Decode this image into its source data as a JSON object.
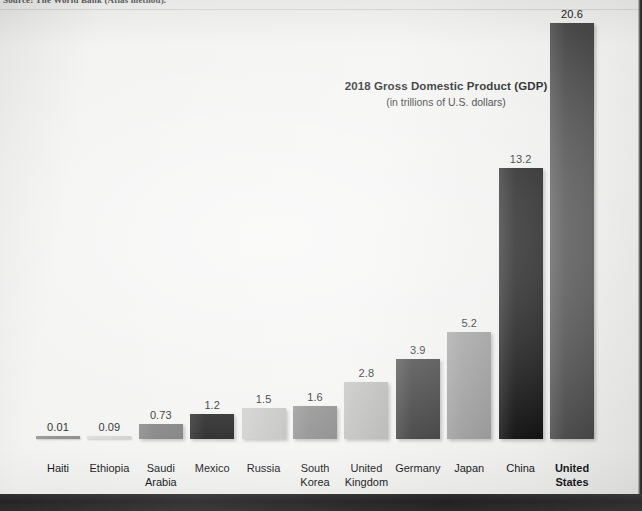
{
  "source_note": "Source: The World Bank (Atlas method).",
  "chart": {
    "title": "2018 Gross Domestic Product (GDP)",
    "subtitle": "(in trillions of U.S. dollars)"
  },
  "chart_data": {
    "type": "bar",
    "title": "2018 Gross Domestic Product (GDP)",
    "subtitle": "(in trillions of U.S. dollars)",
    "xlabel": "",
    "ylabel": "GDP (trillions of U.S. dollars)",
    "ylim": [
      0,
      20.6
    ],
    "grid": false,
    "legend": false,
    "categories": [
      "Haiti",
      "Ethiopia",
      "Saudi Arabia",
      "Mexico",
      "Russia",
      "South Korea",
      "United Kingdom",
      "Germany",
      "Japan",
      "China",
      "United States"
    ],
    "values": [
      0.01,
      0.09,
      0.73,
      1.2,
      1.5,
      1.6,
      2.8,
      3.9,
      5.2,
      13.2,
      20.6
    ],
    "value_labels": [
      "0.01",
      "0.09",
      "0.73",
      "1.2",
      "1.5",
      "1.6",
      "2.8",
      "3.9",
      "5.2",
      "13.2",
      "20.6"
    ],
    "bar_colors": [
      "#8e8e8e",
      "#d8d8d6",
      "#7d7d7d",
      "#171717",
      "#c9c9c7",
      "#8b8b8b",
      "#bdbdbb",
      "#3a3a3a",
      "#9a9a9a",
      "#0d0d0d",
      "#4a4a4a"
    ],
    "bars": [
      {
        "label": "Haiti",
        "label_line2": "",
        "value": 0.01,
        "value_label": "0.01",
        "color": "#8e8e8e",
        "bold": false
      },
      {
        "label": "Ethiopia",
        "label_line2": "",
        "value": 0.09,
        "value_label": "0.09",
        "color": "#d8d8d6",
        "bold": false
      },
      {
        "label": "Saudi",
        "label_line2": "Arabia",
        "value": 0.73,
        "value_label": "0.73",
        "color": "#7d7d7d",
        "bold": false
      },
      {
        "label": "Mexico",
        "label_line2": "",
        "value": 1.2,
        "value_label": "1.2",
        "color": "#171717",
        "bold": false
      },
      {
        "label": "Russia",
        "label_line2": "",
        "value": 1.5,
        "value_label": "1.5",
        "color": "#c9c9c7",
        "bold": false
      },
      {
        "label": "South",
        "label_line2": "Korea",
        "value": 1.6,
        "value_label": "1.6",
        "color": "#8b8b8b",
        "bold": false
      },
      {
        "label": "United",
        "label_line2": "Kingdom",
        "value": 2.8,
        "value_label": "2.8",
        "color": "#bdbdbb",
        "bold": false
      },
      {
        "label": "Germany",
        "label_line2": "",
        "value": 3.9,
        "value_label": "3.9",
        "color": "#3a3a3a",
        "bold": false
      },
      {
        "label": "Japan",
        "label_line2": "",
        "value": 5.2,
        "value_label": "5.2",
        "color": "#9a9a9a",
        "bold": false
      },
      {
        "label": "China",
        "label_line2": "",
        "value": 13.2,
        "value_label": "13.2",
        "color": "#0d0d0d",
        "bold": false
      },
      {
        "label": "United",
        "label_line2": "States",
        "value": 20.6,
        "value_label": "20.6",
        "color": "#4a4a4a",
        "bold": true
      }
    ]
  }
}
